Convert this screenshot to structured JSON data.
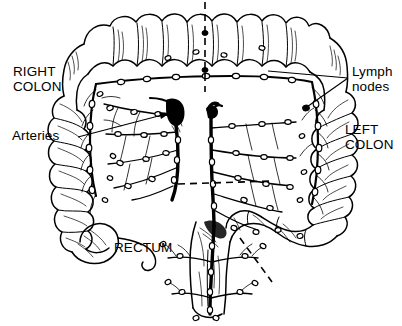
{
  "figure": {
    "type": "line-drawing-illustration",
    "background_color": "#ffffff",
    "ink_color": "#000000"
  },
  "labels": {
    "right_colon": "RIGHT\nCOLON",
    "left_colon": "LEFT\nCOLON",
    "lymph_nodes": "Lymph\nnodes",
    "arteries": "Arteries",
    "rectum": "RECTUM"
  },
  "annotations": {
    "leader_lines": [
      {
        "name": "arteries-leader",
        "from": [
          78,
          136
        ],
        "to": [
          172,
          112
        ],
        "arrow": true
      },
      {
        "name": "lymph-leader-upper",
        "from": [
          348,
          77
        ],
        "to": [
          268,
          70
        ],
        "arrow": false
      },
      {
        "name": "lymph-leader-lower",
        "from": [
          348,
          77
        ],
        "to": [
          305,
          108
        ],
        "arrow": false
      }
    ],
    "dashed_lines": [
      {
        "name": "vertical-midline-dash",
        "x1": 205,
        "y1": 2,
        "x2": 205,
        "y2": 92
      },
      {
        "name": "horizontal-midline-dash",
        "x1": 178,
        "y1": 184,
        "x2": 272,
        "y2": 181
      },
      {
        "name": "rectum-oblique-dash",
        "x1": 240,
        "y1": 238,
        "x2": 272,
        "y2": 282
      }
    ]
  },
  "structures": [
    {
      "name": "transverse-colon",
      "region": "top"
    },
    {
      "name": "ascending-colon",
      "region": "left"
    },
    {
      "name": "descending-colon",
      "region": "right"
    },
    {
      "name": "cecum",
      "region": "lower-left"
    },
    {
      "name": "appendix",
      "region": "lower-left"
    },
    {
      "name": "sigmoid-colon",
      "region": "lower-right"
    },
    {
      "name": "rectum",
      "region": "bottom-center"
    },
    {
      "name": "superior-mesenteric-artery",
      "region": "center-left"
    },
    {
      "name": "inferior-mesenteric-artery",
      "region": "center-right"
    },
    {
      "name": "marginal-artery-arcade",
      "region": "perimeter"
    },
    {
      "name": "lymph-node-chain",
      "region": "along-vessels"
    }
  ]
}
